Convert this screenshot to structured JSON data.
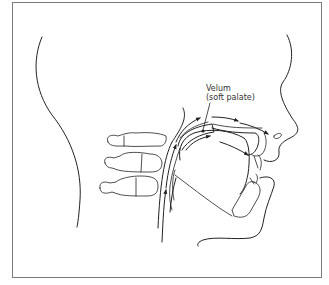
{
  "diagram": {
    "type": "anatomical-line-drawing",
    "labels": [
      {
        "id": "velum",
        "line1": "Velum",
        "line2": "(soft palate)"
      }
    ],
    "colors": {
      "stroke": "#222222",
      "border": "#7a7a7a",
      "background": "#ffffff",
      "label": "#333333"
    },
    "elements": [
      "head-outline-back",
      "face-profile",
      "cervical-vertebrae",
      "pharynx",
      "nasal-cavity",
      "oral-cavity",
      "tongue",
      "jaw",
      "airflow-arrows"
    ]
  }
}
